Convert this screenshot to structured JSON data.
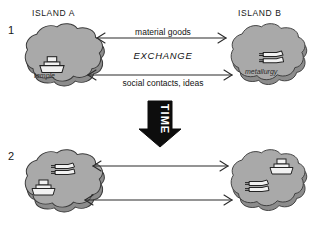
{
  "figure": {
    "background": "#ffffff"
  },
  "colors": {
    "island_fill": "#a9a9a9",
    "island_side": "#8f8f8f",
    "island_stroke": "#3a3a3a",
    "icon_fill": "#f2f2f2",
    "icon_stroke": "#232323",
    "arrow_stroke": "#2a2a2a",
    "time_arrow": "#0d0d0d",
    "text": "#171717"
  },
  "panels": [
    {
      "number": "1",
      "left_island": {
        "name": "ISLAND A",
        "icons": [
          {
            "kind": "temple-icon",
            "caption": "temple"
          }
        ]
      },
      "right_island": {
        "name": "ISLAND B",
        "icons": [
          {
            "kind": "metallurgy-icon",
            "caption": "metallurgy"
          }
        ]
      },
      "flows": [
        {
          "label": "material goods",
          "direction": "bidirectional"
        },
        {
          "label": "social contacts, ideas",
          "direction": "bidirectional"
        }
      ],
      "center_label": "EXCHANGE"
    },
    {
      "number": "2",
      "left_island": {
        "name": "",
        "icons": [
          {
            "kind": "metallurgy-icon",
            "caption": ""
          },
          {
            "kind": "temple-icon",
            "caption": ""
          }
        ]
      },
      "right_island": {
        "name": "",
        "icons": [
          {
            "kind": "temple-icon",
            "caption": ""
          },
          {
            "kind": "metallurgy-icon",
            "caption": ""
          }
        ]
      },
      "flows": [
        {
          "label": "",
          "direction": "bidirectional"
        },
        {
          "label": "",
          "direction": "bidirectional"
        }
      ],
      "center_label": ""
    }
  ],
  "time_arrow": {
    "label": "TIME",
    "direction": "down"
  }
}
